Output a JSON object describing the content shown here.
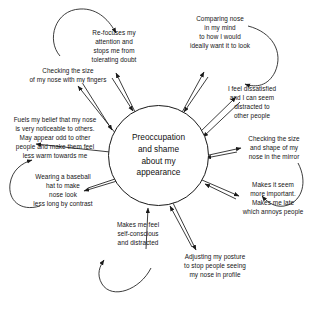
{
  "diagram": {
    "title": "Preoccupation and shame about my appearance",
    "type": "vicious-flower",
    "hub": {
      "label": "Preoccupation\nand shame\nabout my\nappearance"
    },
    "petals": [
      {
        "id": "re-focuses-attention",
        "label": "Re-focuses my\nattention and\nstops me from\ntolerating doubt",
        "position": "top-left"
      },
      {
        "id": "comparing-nose-in-mind",
        "label": "Comparing nose\nin my mind\nto how I would\nideally want it to look",
        "position": "top-right"
      },
      {
        "id": "checking-size-with-fingers",
        "label": "Checking the size\nof my nose with my fingers",
        "position": "upper-left"
      },
      {
        "id": "feel-dissatisfied",
        "label": "I feel dissatisfied\nand I can seem\ndistracted to\nother people",
        "position": "upper-right"
      },
      {
        "id": "fuels-my-belief",
        "label": "Fuels my belief that my nose\nis very noticeable to others.\nMay appear odd to other\npeople and make them feel\nless warm towards me",
        "position": "left"
      },
      {
        "id": "checking-in-mirror",
        "label": "Checking the size\nand shape of my\nnose in the mirror",
        "position": "right"
      },
      {
        "id": "wearing-baseball-hat",
        "label": "Wearing a baseball\nhat to make\nnose look\nless long by contrast",
        "position": "lower-left"
      },
      {
        "id": "makes-it-seem-more-important",
        "label": "Makes it seem\nmore important.\nMakes me late\nwhich annoys people",
        "position": "lower-right"
      },
      {
        "id": "makes-me-feel-self-conscious",
        "label": "Makes me feel\nself-conscious\nand distracted",
        "position": "bottom-left"
      },
      {
        "id": "adjusting-my-posture",
        "label": "Adjusting my posture\nto stop people seeing\nmy nose in profile",
        "position": "bottom-right"
      }
    ],
    "colors": {
      "stroke": "#1a1a1a",
      "text": "#151515",
      "background": "#ffffff"
    }
  }
}
